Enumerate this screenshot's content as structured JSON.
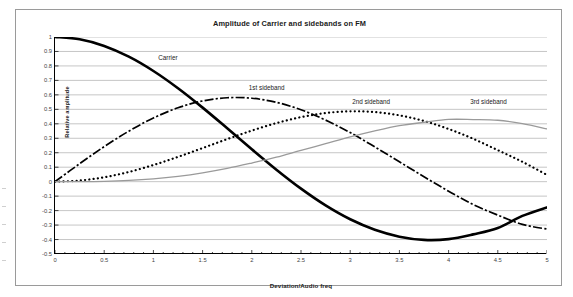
{
  "chart_data": {
    "type": "line",
    "title": "Amplitude of Carrier and sidebands on FM",
    "xlabel": "Deviation/Audio freq",
    "ylabel": "Relative amplitude",
    "xlim": [
      0,
      5
    ],
    "ylim": [
      -0.5,
      1
    ],
    "grid": true,
    "legend_position": "inline-annotations",
    "xticks": [
      "0",
      "0.5",
      "1",
      "1.5",
      "2",
      "2.5",
      "3",
      "3.5",
      "4",
      "4.5",
      "5"
    ],
    "xtick_values": [
      0,
      0.5,
      1,
      1.5,
      2,
      2.5,
      3,
      3.5,
      4,
      4.5,
      5
    ],
    "yticks": [
      "1",
      "0.9",
      "0.8",
      "0.7",
      "0.6",
      "0.5",
      "0.4",
      "0.3",
      "0.2",
      "0.1",
      "0",
      "-0.1",
      "-0.2",
      "-0.3",
      "-0.4",
      "-0.5"
    ],
    "ytick_values": [
      1,
      0.9,
      0.8,
      0.7,
      0.6,
      0.5,
      0.4,
      0.3,
      0.2,
      0.1,
      0,
      -0.1,
      -0.2,
      -0.3,
      -0.4,
      -0.5
    ],
    "x": [
      0,
      0.25,
      0.5,
      0.75,
      1,
      1.25,
      1.5,
      1.75,
      2,
      2.25,
      2.5,
      2.75,
      3,
      3.25,
      3.5,
      3.75,
      4,
      4.25,
      4.5,
      4.75,
      5
    ],
    "series": [
      {
        "name": "Carrier",
        "style": "solid-thick",
        "color": "#000000",
        "values": [
          1.0,
          0.9844,
          0.9385,
          0.8642,
          0.7652,
          0.6459,
          0.5118,
          0.369,
          0.2239,
          0.0827,
          -0.0484,
          -0.1641,
          -0.2601,
          -0.3325,
          -0.3801,
          -0.4026,
          -0.3971,
          -0.3643,
          -0.3205,
          -0.2366,
          -0.1776
        ]
      },
      {
        "name": "1st sideband",
        "style": "dash-dot",
        "color": "#000000",
        "values": [
          0.0,
          0.124,
          0.2423,
          0.3492,
          0.4401,
          0.5106,
          0.5579,
          0.5802,
          0.5767,
          0.5484,
          0.4971,
          0.4256,
          0.3391,
          0.2404,
          0.1374,
          0.034,
          -0.066,
          -0.1585,
          -0.2311,
          -0.2951,
          -0.3276
        ]
      },
      {
        "name": "2nd sideband",
        "style": "dotted",
        "color": "#000000",
        "values": [
          0.0,
          0.0078,
          0.0306,
          0.0671,
          0.1149,
          0.1711,
          0.2321,
          0.294,
          0.3528,
          0.4048,
          0.4461,
          0.4743,
          0.4861,
          0.4813,
          0.4586,
          0.4194,
          0.3641,
          0.2966,
          0.2178,
          0.1374,
          0.0466
        ]
      },
      {
        "name": "3rd sideband",
        "style": "solid-thin",
        "color": "#9a9a9a",
        "values": [
          0.0,
          0.0003,
          0.0026,
          0.0085,
          0.0196,
          0.0369,
          0.061,
          0.0916,
          0.1289,
          0.169,
          0.2166,
          0.2626,
          0.3091,
          0.3507,
          0.3868,
          0.4102,
          0.4302,
          0.4295,
          0.4247,
          0.4007,
          0.3648
        ]
      }
    ],
    "annotations": [
      {
        "text": "Carrier",
        "x": 1.05,
        "y": 0.845
      },
      {
        "text": "1st sideband",
        "x": 1.97,
        "y": 0.64
      },
      {
        "text": "2nd sideband",
        "x": 3.02,
        "y": 0.545
      },
      {
        "text": "3rd sideband",
        "x": 4.22,
        "y": 0.545
      }
    ]
  },
  "colors": {
    "frame_border": "#9a9a9a",
    "axis": "#000000",
    "gridline": "#b8b8b8",
    "carrier": "#000000",
    "sideband1": "#000000",
    "sideband2": "#000000",
    "sideband3": "#9a9a9a",
    "background": "#ffffff",
    "text": "#1a1a1a"
  }
}
